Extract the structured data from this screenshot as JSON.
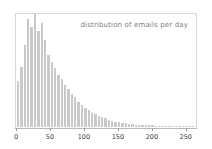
{
  "chart_data": {
    "type": "bar",
    "title": "distribution of emails per day",
    "xlabel": "",
    "ylabel": "",
    "grid": false,
    "legend": false,
    "xlim": [
      0,
      265
    ],
    "ylim": [
      0,
      1.0
    ],
    "bin_width": 5,
    "bar_color": "#c9c9c9",
    "frame_color": "#d7d7d7",
    "title_color": "#7d7d7d",
    "axis_text_color": "#3a3a3a",
    "xticks": [
      {
        "value": 0,
        "label": "0"
      },
      {
        "value": 50,
        "label": "50"
      },
      {
        "value": 100,
        "label": "100"
      },
      {
        "value": 150,
        "label": "150"
      },
      {
        "value": 200,
        "label": "200"
      },
      {
        "value": 250,
        "label": "250"
      }
    ],
    "categories": [
      0,
      5,
      10,
      15,
      20,
      25,
      30,
      35,
      40,
      45,
      50,
      55,
      60,
      65,
      70,
      75,
      80,
      85,
      90,
      95,
      100,
      105,
      110,
      115,
      120,
      125,
      130,
      135,
      140,
      145,
      150,
      155,
      160,
      165,
      170,
      175,
      180,
      185,
      190,
      195,
      200,
      205,
      210,
      215,
      220,
      225,
      230,
      235,
      240,
      245,
      250,
      255,
      260
    ],
    "values": [
      0.4,
      0.53,
      0.72,
      0.95,
      0.88,
      1.0,
      0.84,
      0.91,
      0.76,
      0.63,
      0.57,
      0.52,
      0.46,
      0.42,
      0.37,
      0.33,
      0.29,
      0.26,
      0.22,
      0.19,
      0.17,
      0.145,
      0.125,
      0.11,
      0.095,
      0.085,
      0.075,
      0.065,
      0.055,
      0.048,
      0.042,
      0.037,
      0.032,
      0.028,
      0.025,
      0.022,
      0.02,
      0.018,
      0.016,
      0.015,
      0.014,
      0.013,
      0.012,
      0.011,
      0.01,
      0.009,
      0.009,
      0.008,
      0.008,
      0.007,
      0.007,
      0.006,
      0.006
    ]
  }
}
